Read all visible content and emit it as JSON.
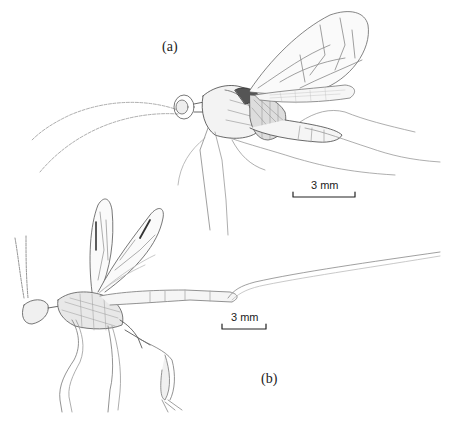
{
  "figure": {
    "panels": [
      {
        "id": "a",
        "label": "(a)",
        "scale_bar": "3 mm"
      },
      {
        "id": "b",
        "label": "(b)",
        "scale_bar": "3 mm"
      }
    ]
  },
  "colors": {
    "ink": "#333333",
    "background": "#ffffff"
  }
}
